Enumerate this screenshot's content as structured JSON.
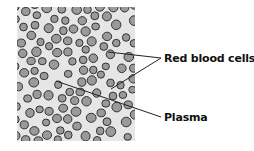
{
  "diagram": {
    "panel": {
      "x": 17,
      "y": 7,
      "width": 118,
      "height": 134,
      "fill": "#e6e6e6"
    },
    "cell_style": {
      "fill": "#9a9a9a",
      "stroke": "#333333"
    },
    "labels": [
      {
        "id": "red-blood-cells",
        "text": "Red blood cells",
        "x": 164,
        "y": 52
      },
      {
        "id": "plasma",
        "text": "Plasma",
        "x": 164,
        "y": 111
      }
    ],
    "leader_lines": [
      {
        "label": "red-blood-cells",
        "x1": 108,
        "y1": 52,
        "x2": 161,
        "y2": 58
      },
      {
        "label": "red-blood-cells",
        "x1": 111,
        "y1": 89,
        "x2": 161,
        "y2": 58
      },
      {
        "label": "plasma",
        "x1": 56,
        "y1": 81,
        "x2": 161,
        "y2": 117
      }
    ]
  }
}
